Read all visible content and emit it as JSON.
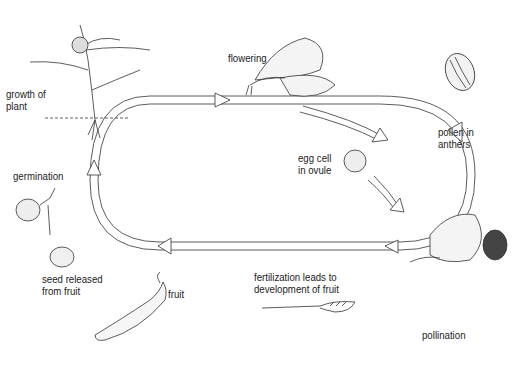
{
  "stages": [
    {
      "id": "growth",
      "label_line1": "growth of",
      "label_line2": "plant",
      "x": 6,
      "y": 88
    },
    {
      "id": "flowering",
      "label_line1": "flowering",
      "label_line2": "",
      "x": 228,
      "y": 52
    },
    {
      "id": "pollen",
      "label_line1": "pollen in",
      "label_line2": "anthers",
      "x": 438,
      "y": 126
    },
    {
      "id": "egg",
      "label_line1": "egg cell",
      "label_line2": "in ovule",
      "x": 298,
      "y": 152
    },
    {
      "id": "pollination",
      "label_line1": "pollination",
      "label_line2": "",
      "x": 422,
      "y": 329
    },
    {
      "id": "fertilization",
      "label_line1": "fertilization leads to",
      "label_line2": "development of fruit",
      "x": 254,
      "y": 271
    },
    {
      "id": "fruit",
      "label_line1": "fruit",
      "label_line2": "",
      "x": 168,
      "y": 288
    },
    {
      "id": "seed",
      "label_line1": "seed released",
      "label_line2": "from fruit",
      "x": 42,
      "y": 273
    },
    {
      "id": "germination",
      "label_line1": "germination",
      "label_line2": "",
      "x": 13,
      "y": 170
    }
  ],
  "colors": {
    "stroke": "#333333",
    "background": "#ffffff",
    "shade": "#e6e6e6"
  }
}
